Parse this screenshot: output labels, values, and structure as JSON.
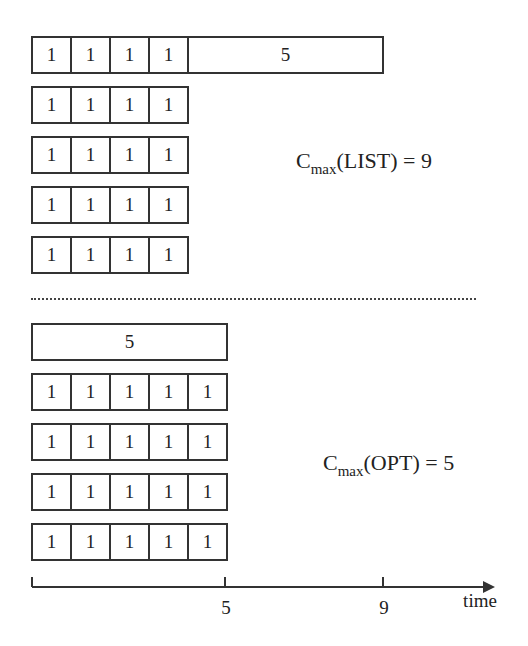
{
  "list_schedule": {
    "label_prefix": "C",
    "label_sub": "max",
    "label_suffix": "(LIST) = 9",
    "rows": [
      {
        "jobs": [
          "1",
          "1",
          "1",
          "1",
          "5"
        ]
      },
      {
        "jobs": [
          "1",
          "1",
          "1",
          "1"
        ]
      },
      {
        "jobs": [
          "1",
          "1",
          "1",
          "1"
        ]
      },
      {
        "jobs": [
          "1",
          "1",
          "1",
          "1"
        ]
      },
      {
        "jobs": [
          "1",
          "1",
          "1",
          "1"
        ]
      }
    ]
  },
  "opt_schedule": {
    "label_prefix": "C",
    "label_sub": "max",
    "label_suffix": "(OPT) = 5",
    "rows": [
      {
        "jobs": [
          "5"
        ]
      },
      {
        "jobs": [
          "1",
          "1",
          "1",
          "1",
          "1"
        ]
      },
      {
        "jobs": [
          "1",
          "1",
          "1",
          "1",
          "1"
        ]
      },
      {
        "jobs": [
          "1",
          "1",
          "1",
          "1",
          "1"
        ]
      },
      {
        "jobs": [
          "1",
          "1",
          "1",
          "1",
          "1"
        ]
      }
    ]
  },
  "axis": {
    "ticks": [
      "5",
      "9"
    ],
    "label": "time"
  }
}
